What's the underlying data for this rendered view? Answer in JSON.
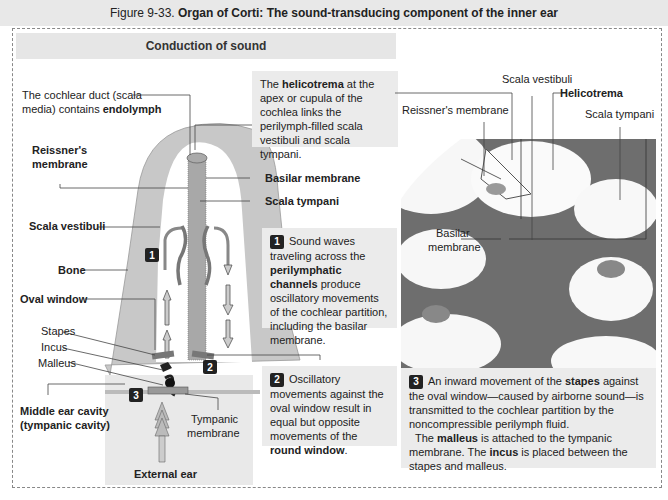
{
  "figure": {
    "number": "Figure 9-33.",
    "title": "Organ of Corti: The sound-transducing component of the inner ear"
  },
  "section": {
    "header": "Conduction of sound"
  },
  "left_labels": {
    "cochlear_duct_1": "The cochlear duct (scala",
    "cochlear_duct_2_plain": "media) contains ",
    "cochlear_duct_2_bold": "endolymph",
    "reissner_1": "Reissner's",
    "reissner_2": "membrane",
    "scala_vestibuli": "Scala vestibuli",
    "bone": "Bone",
    "oval_window": "Oval window",
    "stapes": "Stapes",
    "incus": "Incus",
    "malleus": "Malleus",
    "middle_ear_1": "Middle ear cavity",
    "middle_ear_2": "(tympanic cavity)",
    "tympanic_1": "Tympanic",
    "tympanic_2": "membrane",
    "external_ear": "External ear",
    "basilar_membrane": "Basilar membrane",
    "scala_tympani": "Scala tympani"
  },
  "helicotrema_box": {
    "pre": "The ",
    "bold": "helicotrema",
    "post": " at the apex or cupula of the cochlea links the perilymph-filled scala vestibuli and scala tympani."
  },
  "step1": {
    "number": "1",
    "pre": "Sound waves traveling across the ",
    "bold": "perilymphatic channels",
    "post": " produce oscillatory movements of the cochlear partition, including the basilar membrane."
  },
  "step2": {
    "number": "2",
    "pre": "Oscillatory movements against the oval window result in equal but opposite movements of the ",
    "bold": "round window",
    "post": "."
  },
  "step3": {
    "number": "3",
    "p1_pre": "An inward movement of the ",
    "p1_bold": "stapes",
    "p1_post": " against the oval window—caused by airborne sound—is transmitted to the cochlear partition by the noncompressible perilymph fluid.",
    "p2_pre": "The ",
    "p2_bold1": "malleus",
    "p2_mid": " is attached to the tympanic membrane. The ",
    "p2_bold2": "incus",
    "p2_post": " is placed between the stapes and malleus."
  },
  "photo_labels": {
    "scala_vestibuli": "Scala vestibuli",
    "helicotrema": "Helicotrema",
    "reissner": "Reissner's membrane",
    "scala_tympani": "Scala tympani",
    "basilar_1": "Basilar",
    "basilar_2": "membrane"
  },
  "colors": {
    "bone": "#c8c8c8",
    "partition": "#a8a8a8",
    "box_bg": "#ebebeb",
    "header_bg": "#e6e6e6",
    "tissue": "#6e6e6e"
  }
}
